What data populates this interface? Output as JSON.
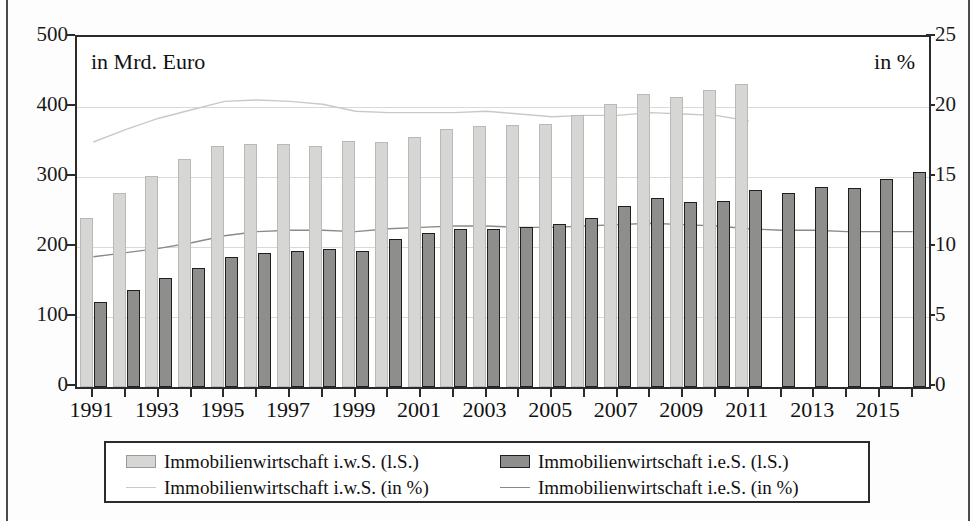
{
  "notes": {
    "left": "in Mrd. Euro",
    "right": "in %"
  },
  "axes": {
    "left": {
      "ticks": [
        0,
        100,
        200,
        300,
        400,
        500
      ],
      "min": 0,
      "max": 500
    },
    "right": {
      "ticks": [
        0,
        5,
        10,
        15,
        20,
        25
      ],
      "min": 0,
      "max": 25
    },
    "x": {
      "labels": [
        "1991",
        "1993",
        "1995",
        "1997",
        "1999",
        "2001",
        "2003",
        "2005",
        "2007",
        "2009",
        "2011",
        "2013",
        "2015"
      ]
    }
  },
  "legend": {
    "items": [
      {
        "key": "bar-light",
        "label": "Immobilienwirtschaft i.w.S. (l.S.)"
      },
      {
        "key": "bar-dark",
        "label": "Immobilienwirtschaft i.e.S. (l.S.)"
      },
      {
        "key": "line-light",
        "label": "Immobilienwirtschaft i.w.S. (in %)"
      },
      {
        "key": "line-dark",
        "label": "Immobilienwirtschaft i.e.S. (in %)"
      }
    ]
  },
  "colors": {
    "bar_light": "#d6d6d4",
    "bar_dark": "#8e8e8c",
    "line_light": "#c9c9c9",
    "line_dark": "#8a8a8a",
    "axis": "#2b2b2b",
    "grid": "#d9d9d9"
  },
  "chart_data": {
    "type": "bar",
    "title": "",
    "xlabel": "",
    "ylabel": "in Mrd. Euro",
    "y2label": "in %",
    "ylim": [
      0,
      500
    ],
    "y2lim": [
      0,
      25
    ],
    "grid": true,
    "legend_position": "bottom",
    "categories": [
      "1991",
      "1992",
      "1993",
      "1994",
      "1995",
      "1996",
      "1997",
      "1998",
      "1999",
      "2000",
      "2001",
      "2002",
      "2003",
      "2004",
      "2005",
      "2006",
      "2007",
      "2008",
      "2009",
      "2010",
      "2011",
      "2012",
      "2013",
      "2014",
      "2015",
      "2016"
    ],
    "series": [
      {
        "name": "Immobilienwirtschaft i.w.S. (l.S.)",
        "axis": "left",
        "unit": "Mrd. Euro",
        "render": "bar",
        "color": "#d6d6d4",
        "values": [
          242,
          277,
          301,
          326,
          344,
          347,
          347,
          344,
          351,
          350,
          357,
          368,
          373,
          374,
          376,
          389,
          405,
          419,
          414,
          425,
          433,
          null,
          null,
          null,
          null,
          null
        ]
      },
      {
        "name": "Immobilienwirtschaft i.e.S. (l.S.)",
        "axis": "left",
        "unit": "Mrd. Euro",
        "render": "bar",
        "color": "#8e8e8c",
        "values": [
          122,
          139,
          156,
          170,
          186,
          192,
          195,
          197,
          194,
          211,
          220,
          226,
          226,
          228,
          233,
          242,
          258,
          270,
          265,
          266,
          281,
          277,
          286,
          285,
          297,
          307
        ]
      },
      {
        "name": "Immobilienwirtschaft i.w.S. (in %)",
        "axis": "right",
        "unit": "%",
        "render": "line",
        "color": "#c9c9c9",
        "values": [
          17.5,
          18.4,
          19.2,
          19.8,
          20.4,
          20.5,
          20.4,
          20.2,
          19.7,
          19.6,
          19.6,
          19.6,
          19.7,
          19.5,
          19.3,
          19.4,
          19.4,
          19.6,
          19.5,
          19.4,
          19.0,
          null,
          null,
          null,
          null,
          null
        ]
      },
      {
        "name": "Immobilienwirtschaft i.e.S. (in %)",
        "axis": "right",
        "unit": "%",
        "render": "line",
        "color": "#8a8a8a",
        "values": [
          9.3,
          9.6,
          9.9,
          10.3,
          10.8,
          11.1,
          11.2,
          11.2,
          11.1,
          11.3,
          11.4,
          11.5,
          11.5,
          11.4,
          11.4,
          11.5,
          11.6,
          11.7,
          11.6,
          11.5,
          11.3,
          11.2,
          11.2,
          11.1,
          11.1,
          11.1
        ]
      }
    ]
  }
}
